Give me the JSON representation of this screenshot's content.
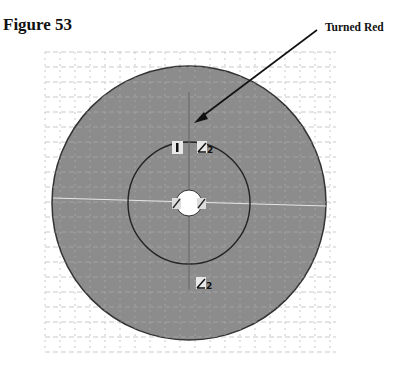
{
  "figure": {
    "title": "Figure 53",
    "callout_label": "Turned Red"
  },
  "drawing": {
    "outer_circle": {
      "cx": 189,
      "cy": 203,
      "r": 137,
      "fill": "#8c8c8c",
      "stroke": "#333333"
    },
    "inner_circle": {
      "cx": 189,
      "cy": 203,
      "r": 61,
      "stroke": "#222222"
    },
    "hole": {
      "cx": 189,
      "cy": 203,
      "r": 13,
      "fill": "#ffffff"
    },
    "constraint_markers": [
      {
        "type": "vertical",
        "label": "I",
        "x": 178,
        "y": 147
      },
      {
        "type": "tangent",
        "label": "2",
        "x": 205,
        "y": 147
      },
      {
        "type": "tangent",
        "label": "",
        "x": 178,
        "y": 203
      },
      {
        "type": "tangent",
        "label": "",
        "x": 200,
        "y": 203
      },
      {
        "type": "tangent",
        "label": "2",
        "x": 200,
        "y": 283
      }
    ],
    "grid": {
      "x0": 45,
      "y0": 52,
      "x1": 336,
      "y1": 352,
      "spacing": 15,
      "color": "#bbbbbb"
    },
    "highlight_color": "#e6e6e6"
  }
}
